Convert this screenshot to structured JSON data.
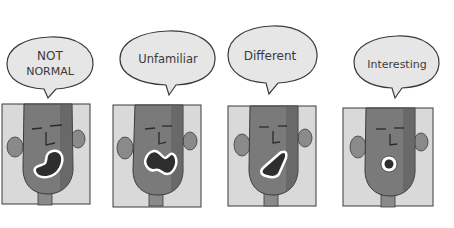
{
  "comic": {
    "panels": [
      {
        "id": 1,
        "bubble_text_lines": [
          "NOT",
          "NORMAL"
        ],
        "mouth_shape": "bean"
      },
      {
        "id": 2,
        "bubble_text_lines": [
          "Unfamiliar"
        ],
        "mouth_shape": "peanut"
      },
      {
        "id": 3,
        "bubble_text_lines": [
          "Different"
        ],
        "mouth_shape": "triangle"
      },
      {
        "id": 4,
        "bubble_text_lines": [
          "Interesting"
        ],
        "mouth_shape": "circle"
      }
    ]
  },
  "colors": {
    "background": "#ffffff",
    "panel_bg": "#d9d9d9",
    "face": "#7a7a7a",
    "face_shadow": "#5e5e5e",
    "bubble_fill": "#e6e6e6",
    "outline": "#3a3a3a",
    "mouth_inner": "#2e2e2e",
    "mouth_rim": "#ffffff"
  }
}
